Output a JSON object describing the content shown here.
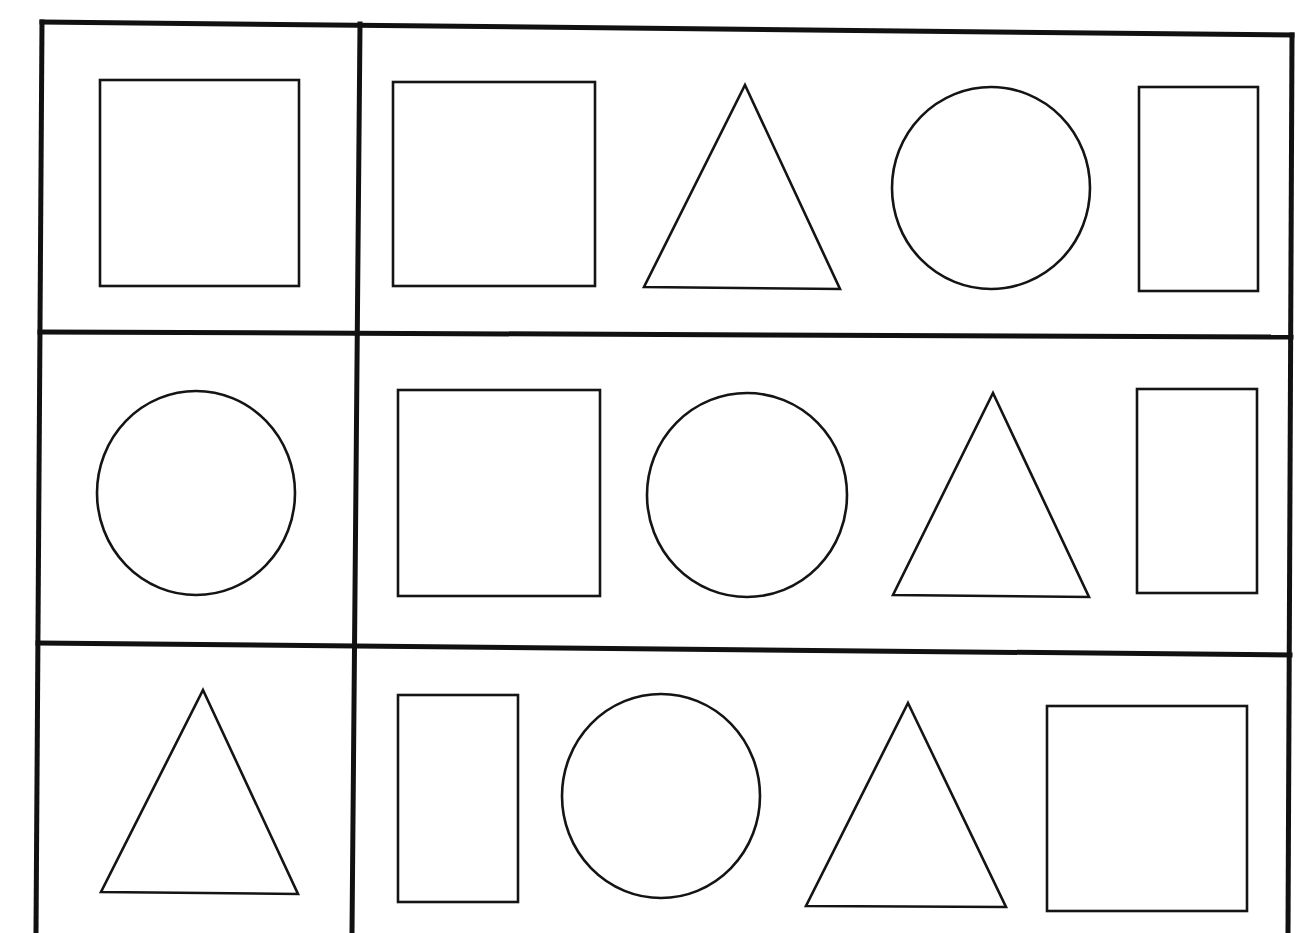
{
  "worksheet": {
    "type": "shape-matching",
    "background_color": "#ffffff",
    "line_color": "#111111",
    "columns": [
      "target",
      "choices"
    ],
    "grid": {
      "outer_frame": {
        "top_left": [
          42,
          22
        ],
        "top_right": [
          1292,
          35
        ],
        "bottom_left": [
          36,
          933
        ],
        "bottom_right": [
          1288,
          933
        ]
      },
      "column_divider": {
        "top": [
          360,
          24
        ],
        "bottom": [
          352,
          933
        ]
      },
      "row_dividers": [
        {
          "left": [
            40,
            332
          ],
          "right": [
            1291,
            337
          ]
        },
        {
          "left": [
            38,
            643
          ],
          "right": [
            1290,
            655
          ]
        }
      ]
    },
    "rows": [
      {
        "index": 1,
        "target": {
          "kind": "square",
          "x": 100,
          "y": 80,
          "w": 199,
          "h": 206
        },
        "choices": [
          {
            "kind": "square",
            "x": 393,
            "y": 82,
            "w": 202,
            "h": 204
          },
          {
            "kind": "triangle",
            "points": [
              [
                745,
                85
              ],
              [
                840,
                289
              ],
              [
                644,
                287
              ]
            ]
          },
          {
            "kind": "circle",
            "cx": 991,
            "cy": 188,
            "rx": 99,
            "ry": 101
          },
          {
            "kind": "rectangle",
            "x": 1139,
            "y": 87,
            "w": 119,
            "h": 204
          }
        ]
      },
      {
        "index": 2,
        "target": {
          "kind": "circle",
          "cx": 196,
          "cy": 493,
          "rx": 99,
          "ry": 102
        },
        "choices": [
          {
            "kind": "square",
            "x": 398,
            "y": 390,
            "w": 202,
            "h": 206
          },
          {
            "kind": "circle",
            "cx": 747,
            "cy": 495,
            "rx": 100,
            "ry": 102
          },
          {
            "kind": "triangle",
            "points": [
              [
                993,
                393
              ],
              [
                1089,
                597
              ],
              [
                893,
                595
              ]
            ]
          },
          {
            "kind": "rectangle",
            "x": 1137,
            "y": 389,
            "w": 120,
            "h": 204
          }
        ]
      },
      {
        "index": 3,
        "target": {
          "kind": "triangle",
          "points": [
            [
              203,
              690
            ],
            [
              298,
              894
            ],
            [
              101,
              892
            ]
          ]
        },
        "choices": [
          {
            "kind": "rectangle",
            "x": 398,
            "y": 695,
            "w": 120,
            "h": 207
          },
          {
            "kind": "circle",
            "cx": 661,
            "cy": 796,
            "rx": 99,
            "ry": 102
          },
          {
            "kind": "triangle",
            "points": [
              [
                908,
                703
              ],
              [
                1006,
                907
              ],
              [
                806,
                906
              ]
            ]
          },
          {
            "kind": "square",
            "x": 1047,
            "y": 706,
            "w": 200,
            "h": 205
          }
        ]
      }
    ]
  }
}
